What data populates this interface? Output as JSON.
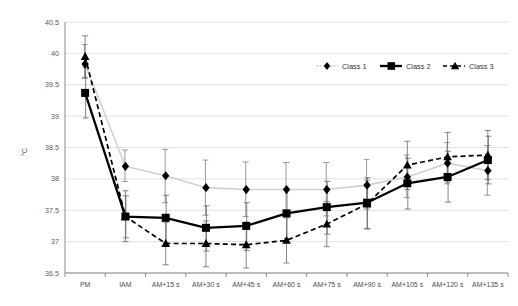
{
  "chart_data": {
    "type": "line",
    "title": "",
    "xlabel": "",
    "ylabel": "°C",
    "ylim": [
      36.5,
      40.5
    ],
    "ytick_step": 0.5,
    "yticks": [
      "36.5",
      "37",
      "37.5",
      "38",
      "38.5",
      "39",
      "39.5",
      "40",
      "40.5"
    ],
    "grid": true,
    "legend_position": "top-right",
    "categories": [
      "PM",
      "IAM",
      "AM+15 s",
      "AM+30 s",
      "AM+45 s",
      "AM+60 s",
      "AM+75 s",
      "AM+90 s",
      "AM+105 s",
      "AM+120 s",
      "AM+135 s"
    ],
    "series": [
      {
        "name": "Class 1",
        "marker": "diamond",
        "linestyle": "solid-light",
        "color": "#d0d0d0",
        "values": [
          39.83,
          38.2,
          38.05,
          37.86,
          37.83,
          37.83,
          37.83,
          37.9,
          38.03,
          38.25,
          38.13
        ],
        "err_low": [
          39.6,
          37.96,
          37.62,
          37.42,
          37.4,
          37.4,
          37.41,
          37.52,
          37.7,
          37.92,
          37.74
        ],
        "err_high": [
          40.14,
          38.46,
          38.47,
          38.3,
          38.27,
          38.26,
          38.26,
          38.31,
          38.38,
          38.58,
          38.53
        ]
      },
      {
        "name": "Class 2",
        "marker": "square",
        "linestyle": "solid-bold",
        "color": "#000000",
        "values": [
          39.37,
          37.4,
          37.38,
          37.22,
          37.25,
          37.45,
          37.55,
          37.62,
          37.93,
          38.03,
          38.3
        ],
        "err_low": [
          38.97,
          37.06,
          36.98,
          36.85,
          36.86,
          37.05,
          37.12,
          37.2,
          37.52,
          37.63,
          37.92
        ],
        "err_high": [
          39.78,
          37.73,
          37.74,
          37.57,
          37.62,
          37.83,
          37.96,
          38.02,
          38.33,
          38.44,
          38.68
        ]
      },
      {
        "name": "Class 3",
        "marker": "triangle",
        "linestyle": "dashed",
        "color": "#000000",
        "values": [
          39.95,
          37.4,
          36.97,
          36.97,
          36.95,
          37.02,
          37.28,
          37.6,
          38.22,
          38.35,
          38.38
        ],
        "err_low": [
          39.62,
          37.0,
          36.63,
          36.6,
          36.58,
          36.66,
          36.92,
          37.21,
          37.83,
          37.95,
          37.99
        ],
        "err_high": [
          40.28,
          37.81,
          37.31,
          37.33,
          37.31,
          37.38,
          37.64,
          37.98,
          38.6,
          38.74,
          38.77
        ]
      }
    ]
  }
}
